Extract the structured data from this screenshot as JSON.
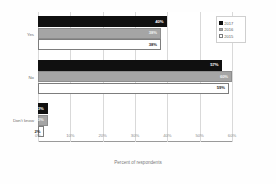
{
  "chart_data": {
    "type": "bar",
    "orientation": "horizontal",
    "title": "",
    "xlabel": "Percent of respondents",
    "ylabel": "",
    "xlim": [
      0,
      60
    ],
    "xticks": [
      "0%",
      "10%",
      "20%",
      "30%",
      "40%",
      "50%",
      "60%"
    ],
    "xtick_values": [
      0,
      10,
      20,
      30,
      40,
      50,
      60
    ],
    "grid": true,
    "legend_position": "top-right",
    "categories": [
      "Yes",
      "No",
      "Don't know"
    ],
    "series": [
      {
        "name": "2017",
        "color": "#101010",
        "values": [
          40,
          57,
          3
        ],
        "labels": [
          "40%",
          "57%",
          "3%"
        ]
      },
      {
        "name": "2016",
        "color": "#a5a5a5",
        "values": [
          38,
          60,
          3
        ],
        "labels": [
          "38%",
          "60%",
          "3%"
        ]
      },
      {
        "name": "2015",
        "color": "#ffffff",
        "values": [
          38,
          59,
          2
        ],
        "labels": [
          "38%",
          "59%",
          "2%"
        ]
      }
    ]
  },
  "legend": {
    "items": [
      {
        "label": "2017",
        "swatch": "s2017"
      },
      {
        "label": "2016",
        "swatch": "s2016"
      },
      {
        "label": "2015",
        "swatch": "s2015"
      }
    ]
  }
}
